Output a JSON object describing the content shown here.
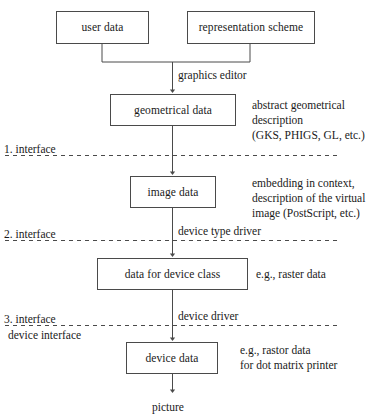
{
  "diagram": {
    "stroke_color": "#4a4a4a",
    "text_color": "#1a1a1a",
    "background": "#ffffff",
    "nodes": [
      {
        "id": "user-data",
        "label": "user data"
      },
      {
        "id": "representation-scheme",
        "label": "representation scheme"
      },
      {
        "id": "geometrical-data",
        "label": "geometrical data"
      },
      {
        "id": "image-data",
        "label": "image data"
      },
      {
        "id": "data-for-device-class",
        "label": "data for device class"
      },
      {
        "id": "device-data",
        "label": "device data"
      }
    ],
    "edge_labels": [
      {
        "id": "graphics-editor",
        "label": "graphics editor"
      },
      {
        "id": "device-type-driver",
        "label": "device type driver"
      },
      {
        "id": "device-driver",
        "label": "device driver"
      }
    ],
    "annotations": [
      {
        "id": "geometrical-annotation",
        "label": "abstract geometrical\ndescription\n(GKS, PHIGS, GL, etc.)"
      },
      {
        "id": "image-annotation",
        "label": "embedding in context,\ndescription of the virtual\nimage (PostScript, etc.)"
      },
      {
        "id": "device-class-annotation",
        "label": "e.g., raster data"
      },
      {
        "id": "device-data-annotation",
        "label": "e.g., rastor data\nfor dot matrix printer"
      }
    ],
    "interfaces": [
      {
        "id": "interface-1",
        "label": "1. interface",
        "sublabel": ""
      },
      {
        "id": "interface-2",
        "label": "2. interface",
        "sublabel": ""
      },
      {
        "id": "interface-3",
        "label": "3. interface",
        "sublabel": "device interface"
      }
    ],
    "terminal": {
      "id": "picture",
      "label": "picture"
    }
  }
}
